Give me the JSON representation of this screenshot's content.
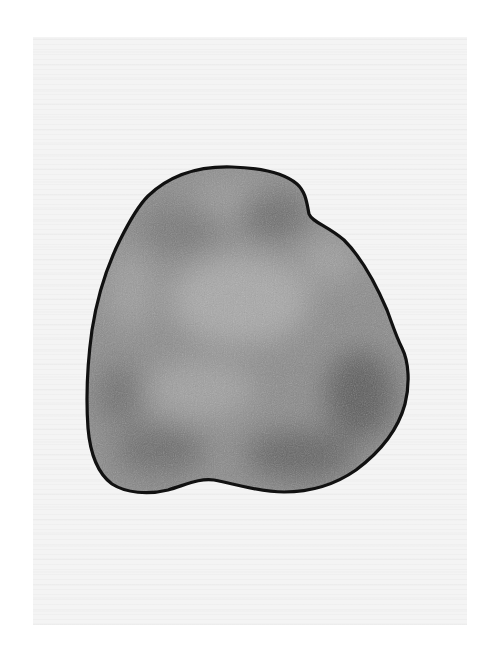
{
  "image": {
    "description": "Scanned pencil/charcoal drawing of a single rounded, potato-like blob shape, shaded in mottled gray with a heavy black outline, on off-white paper",
    "subject": "shaded blob shape",
    "colors": {
      "page_background": "#ffffff",
      "paper": "#f4f4f4",
      "fill_base": "#8a8a8a",
      "fill_dark": "#5e5e5e",
      "fill_light": "#a6a6a6",
      "outline": "#111111"
    }
  }
}
